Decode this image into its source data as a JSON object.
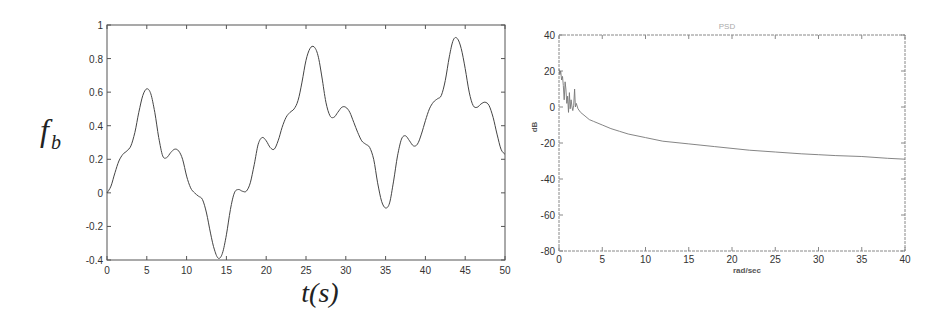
{
  "chart_data": [
    {
      "id": "time-series",
      "type": "line",
      "title": "",
      "xlabel": "t(s)",
      "ylabel": "f_b",
      "ylabel_main": "f",
      "ylabel_sub": "b",
      "xlim": [
        0,
        50
      ],
      "ylim": [
        -0.4,
        1
      ],
      "grid": false,
      "legend": null,
      "xticks": [
        0,
        5,
        10,
        15,
        20,
        25,
        30,
        35,
        40,
        45,
        50
      ],
      "xtick_labels": [
        "0",
        "5",
        "10",
        "15",
        "20",
        "25",
        "30",
        "35",
        "40",
        "45",
        "50"
      ],
      "yticks": [
        -0.4,
        -0.2,
        0,
        0.2,
        0.4,
        0.6,
        0.8,
        1
      ],
      "ytick_labels": [
        "-0.4",
        "-0.2",
        "0",
        "0.2",
        "0.4",
        "0.6",
        "0.8",
        "1"
      ],
      "series": [
        {
          "name": "f_b",
          "color": "#444444",
          "x": [
            0,
            0.5,
            1,
            1.5,
            2,
            2.5,
            3,
            3.5,
            4,
            4.5,
            5,
            5.5,
            6,
            6.5,
            7,
            7.5,
            8,
            8.5,
            9,
            9.5,
            10,
            10.5,
            11,
            11.5,
            12,
            12.5,
            13,
            13.5,
            14,
            14.5,
            15,
            15.5,
            16,
            16.5,
            17,
            17.5,
            18,
            18.5,
            19,
            19.5,
            20,
            20.5,
            21,
            21.5,
            22,
            22.5,
            23,
            23.5,
            24,
            24.5,
            25,
            25.5,
            26,
            26.5,
            27,
            27.5,
            28,
            28.5,
            29,
            29.5,
            30,
            30.5,
            31,
            31.5,
            32,
            32.5,
            33,
            33.5,
            34,
            34.5,
            35,
            35.5,
            36,
            36.5,
            37,
            37.5,
            38,
            38.5,
            39,
            39.5,
            40,
            40.5,
            41,
            41.5,
            42,
            42.5,
            43,
            43.5,
            44,
            44.5,
            45,
            45.5,
            46,
            46.5,
            47,
            47.5,
            48,
            48.5,
            49,
            49.5,
            50
          ],
          "y": [
            0,
            0.04,
            0.12,
            0.19,
            0.23,
            0.25,
            0.28,
            0.36,
            0.48,
            0.58,
            0.62,
            0.59,
            0.48,
            0.33,
            0.22,
            0.21,
            0.24,
            0.26,
            0.25,
            0.2,
            0.1,
            0.03,
            0.0,
            -0.02,
            -0.04,
            -0.12,
            -0.24,
            -0.34,
            -0.39,
            -0.36,
            -0.25,
            -0.1,
            0.0,
            0.02,
            0.01,
            0.01,
            0.06,
            0.17,
            0.29,
            0.33,
            0.31,
            0.27,
            0.26,
            0.31,
            0.39,
            0.45,
            0.48,
            0.5,
            0.55,
            0.66,
            0.79,
            0.86,
            0.87,
            0.82,
            0.69,
            0.54,
            0.46,
            0.45,
            0.48,
            0.51,
            0.51,
            0.48,
            0.42,
            0.36,
            0.31,
            0.29,
            0.27,
            0.2,
            0.06,
            -0.05,
            -0.09,
            -0.06,
            0.07,
            0.22,
            0.32,
            0.34,
            0.31,
            0.28,
            0.29,
            0.35,
            0.43,
            0.5,
            0.54,
            0.56,
            0.58,
            0.67,
            0.81,
            0.91,
            0.92,
            0.86,
            0.74,
            0.6,
            0.52,
            0.51,
            0.53,
            0.54,
            0.52,
            0.45,
            0.35,
            0.26,
            0.23
          ]
        }
      ]
    },
    {
      "id": "psd",
      "type": "line",
      "title": "PSD",
      "xlabel": "rad/sec",
      "ylabel": "dB",
      "xlim": [
        0,
        40
      ],
      "ylim": [
        -80,
        40
      ],
      "grid": false,
      "legend": null,
      "xticks": [
        0,
        5,
        10,
        15,
        20,
        25,
        30,
        35,
        40
      ],
      "xtick_labels": [
        "0",
        "5",
        "10",
        "15",
        "20",
        "25",
        "30",
        "35",
        "40"
      ],
      "yticks": [
        -80,
        -60,
        -40,
        -20,
        0,
        20,
        40
      ],
      "ytick_labels": [
        "-80",
        "-60",
        "-40",
        "-20",
        "0",
        "20",
        "40"
      ],
      "series": [
        {
          "name": "PSD",
          "color": "#777777",
          "x": [
            0,
            0.1,
            0.2,
            0.3,
            0.4,
            0.5,
            0.6,
            0.7,
            0.8,
            0.9,
            1.0,
            1.1,
            1.2,
            1.3,
            1.4,
            1.5,
            1.6,
            1.7,
            1.8,
            1.9,
            2.0,
            2.2,
            2.5,
            3,
            3.5,
            4,
            5,
            6,
            7,
            8,
            10,
            12,
            15,
            18,
            20,
            22,
            25,
            28,
            30,
            32,
            35,
            38,
            40
          ],
          "y": [
            21,
            18,
            20,
            15,
            17,
            12,
            4,
            14,
            10,
            2,
            6,
            -3,
            8,
            -1,
            4,
            0,
            -2,
            1,
            10,
            0,
            2,
            -1,
            -3,
            -5,
            -7,
            -8,
            -10,
            -12,
            -13.5,
            -15,
            -17,
            -19,
            -20.5,
            -22,
            -23,
            -24,
            -25,
            -26,
            -26.5,
            -27,
            -27.5,
            -28.5,
            -29
          ]
        }
      ]
    }
  ]
}
